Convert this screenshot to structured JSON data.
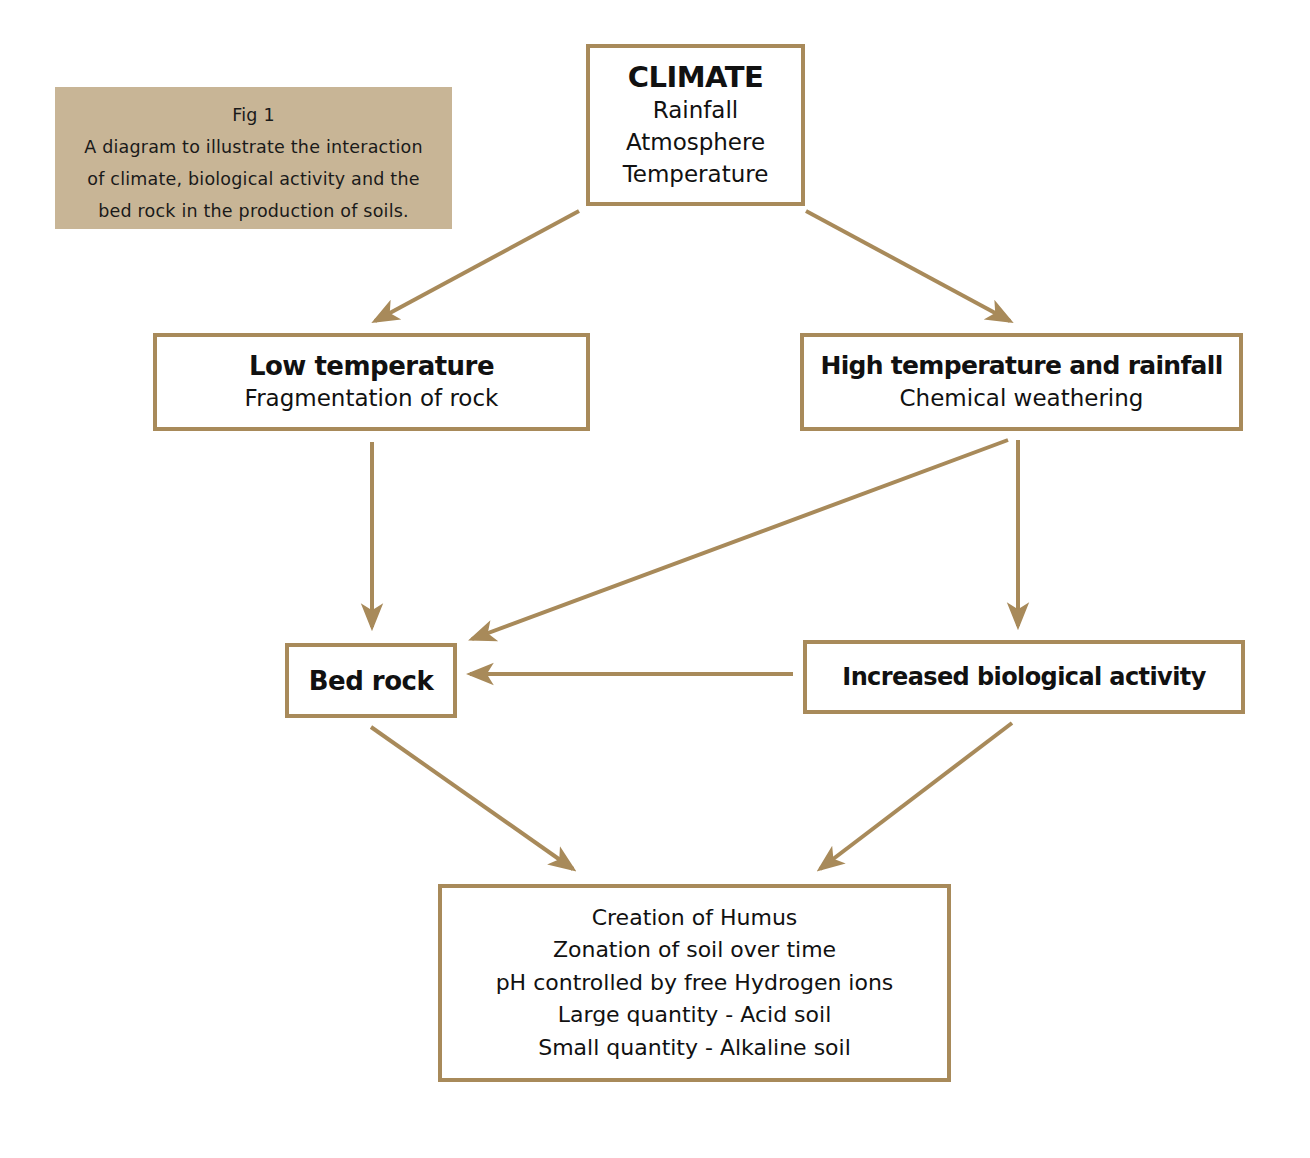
{
  "caption": {
    "lines": [
      "Fig 1",
      "A diagram to illustrate the interaction",
      "of climate, biological activity and the",
      "bed rock in the production of soils."
    ],
    "background": "#c8b596"
  },
  "colors": {
    "border": "#a88a5a",
    "arrow": "#a88a5a",
    "text": "#111111"
  },
  "nodes": {
    "climate": {
      "title": "CLIMATE",
      "lines": [
        "Rainfall",
        "Atmosphere",
        "Temperature"
      ]
    },
    "low_temperature": {
      "title": "Low temperature",
      "lines": [
        "Fragmentation of rock"
      ]
    },
    "high_temperature": {
      "title": "High temperature and rainfall",
      "lines": [
        "Chemical weathering"
      ]
    },
    "bed_rock": {
      "title": "Bed rock"
    },
    "biological_activity": {
      "title": "Increased biological activity"
    },
    "soil_result": {
      "lines": [
        "Creation of Humus",
        "Zonation of soil over time",
        "pH controlled by free Hydrogen ions",
        "Large quantity - Acid soil",
        "Small quantity - Alkaline soil"
      ]
    }
  },
  "edges": [
    {
      "from": "climate",
      "to": "low_temperature"
    },
    {
      "from": "climate",
      "to": "high_temperature"
    },
    {
      "from": "low_temperature",
      "to": "bed_rock"
    },
    {
      "from": "high_temperature",
      "to": "bed_rock"
    },
    {
      "from": "high_temperature",
      "to": "biological_activity"
    },
    {
      "from": "biological_activity",
      "to": "bed_rock"
    },
    {
      "from": "bed_rock",
      "to": "soil_result"
    },
    {
      "from": "biological_activity",
      "to": "soil_result"
    }
  ]
}
